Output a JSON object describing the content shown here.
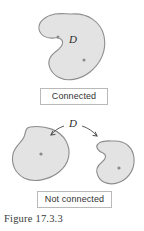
{
  "figure": {
    "caption": "Figure 17.3.3",
    "palette": {
      "region_fill": "#e3e3e3",
      "region_stroke": "#8d8d8d",
      "point_color": "#8a8a8a",
      "box_border": "#b9b9b9",
      "text_color": "#333333",
      "background": "#ffffff",
      "arrow_color": "#4a4a4a"
    },
    "panels": [
      {
        "name": "connected-panel",
        "box_label": "Connected",
        "region_label": "D",
        "region_count": 1,
        "marked_points": 2
      },
      {
        "name": "not-connected-panel",
        "box_label": "Not connected",
        "region_label": "D",
        "region_count": 2,
        "marked_points": 2,
        "arrows": 2
      }
    ]
  }
}
